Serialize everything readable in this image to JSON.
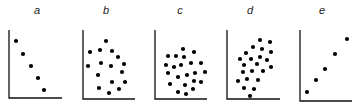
{
  "chart_data": {
    "type": "scatter",
    "title": "",
    "grid": false,
    "axis_color": "#111111",
    "dot_color": "#000000",
    "panels": [
      {
        "label": "a",
        "description": "perfect negative correlation",
        "label_pos": [
          37,
          14
        ],
        "axis": {
          "x0": 9,
          "y_top": 30,
          "y0": 98,
          "x_end": 62
        },
        "points": [
          [
            16,
            41
          ],
          [
            23,
            54
          ],
          [
            31,
            66
          ],
          [
            38,
            78
          ],
          [
            44,
            90
          ]
        ]
      },
      {
        "label": "b",
        "description": "weak / no correlation",
        "label_pos": [
          106,
          14
        ],
        "axis": {
          "x0": 83,
          "y_top": 30,
          "y0": 99,
          "x_end": 135
        },
        "points": [
          [
            106,
            41
          ],
          [
            90,
            52
          ],
          [
            100,
            50
          ],
          [
            112,
            51
          ],
          [
            118,
            57
          ],
          [
            124,
            64
          ],
          [
            88,
            66
          ],
          [
            101,
            63
          ],
          [
            111,
            66
          ],
          [
            122,
            72
          ],
          [
            98,
            75
          ],
          [
            112,
            82
          ],
          [
            125,
            82
          ],
          [
            99,
            88
          ],
          [
            109,
            93
          ],
          [
            119,
            89
          ]
        ]
      },
      {
        "label": "c",
        "description": "no correlation",
        "label_pos": [
          180,
          14
        ],
        "axis": {
          "x0": 155,
          "y_top": 30,
          "y0": 99,
          "x_end": 207
        },
        "points": [
          [
            183,
            49
          ],
          [
            194,
            52
          ],
          [
            168,
            56
          ],
          [
            176,
            56
          ],
          [
            184,
            57
          ],
          [
            191,
            63
          ],
          [
            201,
            63
          ],
          [
            166,
            65
          ],
          [
            174,
            67
          ],
          [
            181,
            65
          ],
          [
            205,
            72
          ],
          [
            195,
            73
          ],
          [
            187,
            75
          ],
          [
            168,
            73
          ],
          [
            178,
            77
          ],
          [
            194,
            81
          ],
          [
            201,
            82
          ],
          [
            185,
            85
          ],
          [
            170,
            84
          ],
          [
            193,
            89
          ],
          [
            178,
            92
          ],
          [
            186,
            94
          ]
        ]
      },
      {
        "label": "d",
        "description": "positive correlation",
        "label_pos": [
          250,
          14
        ],
        "axis": {
          "x0": 227,
          "y_top": 30,
          "y0": 99,
          "x_end": 280
        },
        "points": [
          [
            260,
            40
          ],
          [
            270,
            42
          ],
          [
            253,
            47
          ],
          [
            262,
            49
          ],
          [
            271,
            52
          ],
          [
            246,
            53
          ],
          [
            260,
            57
          ],
          [
            240,
            59
          ],
          [
            251,
            59
          ],
          [
            267,
            60
          ],
          [
            244,
            65
          ],
          [
            257,
            64
          ],
          [
            271,
            67
          ],
          [
            243,
            72
          ],
          [
            252,
            71
          ],
          [
            263,
            71
          ],
          [
            238,
            81
          ],
          [
            247,
            79
          ],
          [
            258,
            80
          ],
          [
            244,
            88
          ],
          [
            254,
            89
          ],
          [
            250,
            96
          ]
        ]
      },
      {
        "label": "e",
        "description": "perfect positive correlation",
        "label_pos": [
          322,
          14
        ],
        "axis": {
          "x0": 300,
          "y_top": 30,
          "y0": 101,
          "x_end": 352
        },
        "points": [
          [
            347,
            39
          ],
          [
            335,
            54
          ],
          [
            325,
            69
          ],
          [
            316,
            80
          ],
          [
            307,
            92
          ]
        ]
      }
    ],
    "xlabel": "",
    "ylabel": ""
  }
}
